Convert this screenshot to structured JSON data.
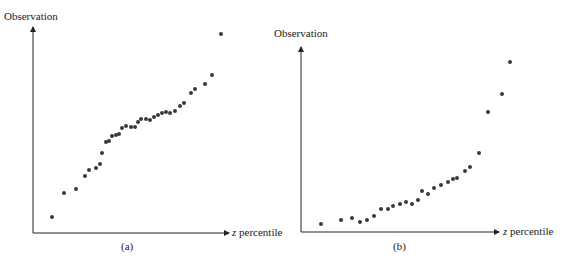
{
  "chart_data": [
    {
      "type": "scatter",
      "title": "",
      "panel_label": "(a)",
      "xlabel_italic": "z",
      "xlabel": "percentile",
      "ylabel": "Observation",
      "grid": false,
      "legend": null,
      "pixel_frame": {
        "origin": [
          33,
          233
        ],
        "y_top": 29,
        "x_right": 227
      },
      "points": [
        [
          52,
          217
        ],
        [
          64,
          193
        ],
        [
          76,
          189
        ],
        [
          85,
          176
        ],
        [
          89,
          170
        ],
        [
          96,
          168
        ],
        [
          100,
          164
        ],
        [
          102,
          153
        ],
        [
          106,
          142
        ],
        [
          109,
          141
        ],
        [
          112,
          136
        ],
        [
          116,
          135
        ],
        [
          119,
          134
        ],
        [
          122,
          128
        ],
        [
          126,
          126
        ],
        [
          131,
          127
        ],
        [
          135,
          127
        ],
        [
          138,
          122
        ],
        [
          141,
          119
        ],
        [
          146,
          119
        ],
        [
          150,
          120
        ],
        [
          154,
          117
        ],
        [
          158,
          115
        ],
        [
          162,
          113
        ],
        [
          166,
          112
        ],
        [
          170,
          113
        ],
        [
          175,
          111
        ],
        [
          180,
          106
        ],
        [
          184,
          103
        ],
        [
          191,
          93
        ],
        [
          195,
          89
        ],
        [
          205,
          84
        ],
        [
          212,
          75
        ],
        [
          221,
          34
        ]
      ]
    },
    {
      "type": "scatter",
      "title": "",
      "panel_label": "(b)",
      "xlabel_italic": "z",
      "xlabel": "percentile",
      "ylabel": "Observation",
      "grid": false,
      "legend": null,
      "pixel_frame": {
        "origin": [
          301,
          232
        ],
        "y_top": 49,
        "x_right": 497
      },
      "points": [
        [
          321,
          224
        ],
        [
          341,
          220
        ],
        [
          352,
          218
        ],
        [
          360,
          222
        ],
        [
          367,
          220
        ],
        [
          374,
          216
        ],
        [
          381,
          209
        ],
        [
          388,
          209
        ],
        [
          393,
          206
        ],
        [
          400,
          204
        ],
        [
          406,
          202
        ],
        [
          412,
          204
        ],
        [
          418,
          200
        ],
        [
          422,
          191
        ],
        [
          428,
          194
        ],
        [
          434,
          188
        ],
        [
          441,
          185
        ],
        [
          448,
          182
        ],
        [
          453,
          179
        ],
        [
          457,
          178
        ],
        [
          465,
          171
        ],
        [
          470,
          167
        ],
        [
          479,
          153
        ],
        [
          488,
          112
        ],
        [
          502,
          94
        ],
        [
          510,
          62
        ]
      ]
    }
  ],
  "panels": {
    "a": {
      "ylabel": "Observation",
      "xlabel_z": "z",
      "xlabel_rest": " percentile",
      "caption": "(a)"
    },
    "b": {
      "ylabel": "Observation",
      "xlabel_z": "z",
      "xlabel_rest": " percentile",
      "caption": "(b)"
    }
  },
  "colors": {
    "point": "#3a3a3a",
    "axis": "#222222",
    "text": "#1a1a1a"
  }
}
